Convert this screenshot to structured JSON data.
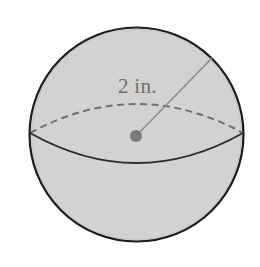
{
  "figure": {
    "name": "sphere-with-radius",
    "canvas": {
      "width": 260,
      "height": 267,
      "background": "#ffffff"
    },
    "sphere": {
      "center_x": 136.5,
      "center_y": 134.5,
      "radius": 107,
      "fill": "#d2d2d2",
      "outline_color": "#1c1c1c",
      "outline_width": 2.2
    },
    "equator_front": {
      "label": "front-equator-arc",
      "style": "solid",
      "color": "#2b2b2b",
      "width": 1.8,
      "start_x": 30,
      "start_y": 133,
      "end_x": 243,
      "end_y": 133,
      "sag_y": 163
    },
    "equator_back": {
      "label": "back-equator-arc",
      "style": "dashed",
      "color": "#707070",
      "width": 2,
      "dash": "7 4.5",
      "start_x": 30,
      "start_y": 133,
      "end_x": 243,
      "end_y": 133,
      "rise_y": 104
    },
    "center_point": {
      "label": "center-dot",
      "x": 136,
      "y": 136,
      "radius": 6,
      "fill": "#7a7a7a"
    },
    "radius_segment": {
      "label": "radius-line",
      "from_x": 136,
      "from_y": 136,
      "to_x": 212,
      "to_y": 58,
      "color": "#8a8a8a",
      "width": 1.6
    },
    "measurement_label": {
      "text": "2 in.",
      "value": 2,
      "unit": "in.",
      "x": 118,
      "y": 93,
      "color": "#6e6e6e",
      "font_size": 21
    }
  }
}
